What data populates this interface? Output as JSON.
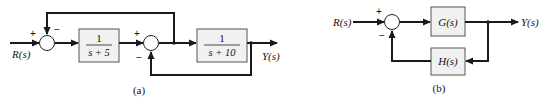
{
  "diagram_a": {
    "caption": "(a)",
    "input_label": "R(s)",
    "output_label": "Y(s)",
    "sum1": {
      "signs": {
        "input": "+",
        "feedback": "−"
      }
    },
    "block1": {
      "numerator": "1",
      "denominator": "s + 5"
    },
    "sum2": {
      "signs": {
        "input": "+",
        "feedback": "−"
      }
    },
    "block2": {
      "numerator": "1",
      "denominator": "s + 10"
    }
  },
  "diagram_b": {
    "caption": "(b)",
    "input_label": "R(s)",
    "output_label": "Y(s)",
    "sum": {
      "signs": {
        "input": "+",
        "feedback": "−"
      }
    },
    "forward_block": {
      "label": "G(s)"
    },
    "feedback_block": {
      "label": "H(s)"
    }
  },
  "colors": {
    "line": "#1a1a1a",
    "block_fill": "#f1f1f1",
    "block_stroke": "#555555",
    "background": "#ffffff"
  }
}
